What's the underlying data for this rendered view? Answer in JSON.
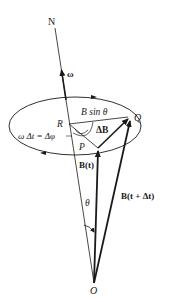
{
  "figure": {
    "type": "vector precession diagram",
    "colors": {
      "ink": "#1a1a1a",
      "background": "#ffffff"
    },
    "labels": {
      "N": "N",
      "omega": "ω",
      "B_sin_theta": "B sin θ",
      "Q": "Q",
      "R": "R",
      "delta_B": "ΔB",
      "omega_dt": "ω Δt = Δφ",
      "P": "P",
      "B_t": "B(t)",
      "B_t_dt": "B(t + Δt)",
      "theta": "θ",
      "O": "O"
    },
    "points": {
      "N": [
        55,
        28
      ],
      "O": [
        94,
        283
      ],
      "R": [
        69,
        124
      ],
      "P": [
        98,
        148
      ],
      "Q": [
        131,
        117
      ]
    }
  }
}
